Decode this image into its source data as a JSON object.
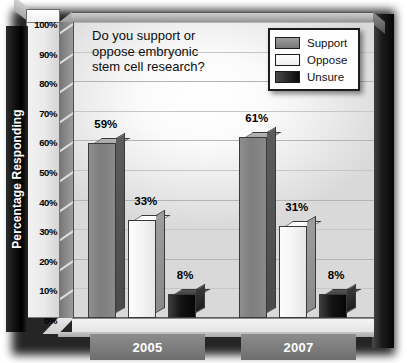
{
  "chart_data": {
    "type": "bar",
    "title_lines": [
      "Do you support or",
      "oppose embryonic",
      "stem cell research?"
    ],
    "xlabel": "",
    "ylabel": "Percentage Responding",
    "ylim": [
      0,
      100
    ],
    "ytick_labels": [
      "100%",
      "90%",
      "80%",
      "70%",
      "60%",
      "50%",
      "40%",
      "30%",
      "20%",
      "10%",
      "0%"
    ],
    "ytick_values": [
      100,
      90,
      80,
      70,
      60,
      50,
      40,
      30,
      20,
      10,
      0
    ],
    "grid": true,
    "legend_position": "top-right",
    "categories": [
      "2005",
      "2007"
    ],
    "series": [
      {
        "name": "Support",
        "color": "#7e7e7e",
        "values": [
          59,
          61
        ],
        "labels": [
          "59%",
          "61%"
        ]
      },
      {
        "name": "Oppose",
        "color": "#f4f4f4",
        "values": [
          33,
          31
        ],
        "labels": [
          "33%",
          "31%"
        ]
      },
      {
        "name": "Unsure",
        "color": "#141414",
        "values": [
          8,
          8
        ],
        "labels": [
          "8%",
          "8%"
        ]
      }
    ]
  },
  "legend": {
    "entries": [
      {
        "label": "Support",
        "swatch": "support-swatch"
      },
      {
        "label": "Oppose",
        "swatch": "oppose-swatch"
      },
      {
        "label": "Unsure",
        "swatch": "unsure-swatch"
      }
    ]
  },
  "axis": {
    "y_title": "Percentage Responding"
  }
}
